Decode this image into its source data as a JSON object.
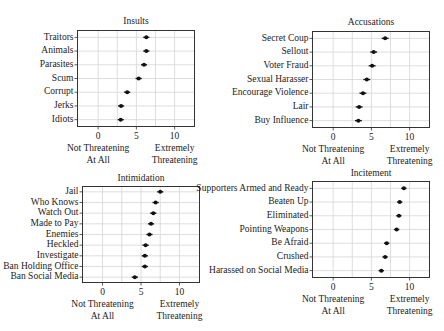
{
  "chart_data": [
    {
      "type": "scatter",
      "title": "Insults",
      "xlabel": "",
      "ylabel": "",
      "xlim": [
        -2.7,
        12.6
      ],
      "xticks": [
        0,
        5,
        10
      ],
      "gridlines_x": [
        0,
        2.5,
        5,
        7.5,
        10
      ],
      "grid": true,
      "x_annotations": {
        "low": [
          "Not Threatening",
          "At All"
        ],
        "high": [
          "Extremely",
          "Threatening"
        ]
      },
      "categories": [
        "Traitors",
        "Animals",
        "Parasites",
        "Scum",
        "Corrupt",
        "Jerks",
        "Idiots"
      ],
      "values": [
        6.3,
        6.3,
        6.0,
        5.3,
        3.8,
        3.0,
        2.95
      ],
      "error_halfwidth": 0.4,
      "frame": {
        "x": 77.5,
        "y": 30.5,
        "w": 117,
        "h": 96
      },
      "title_y": 24
    },
    {
      "type": "scatter",
      "title": "Accusations",
      "xlabel": "",
      "ylabel": "",
      "xlim": [
        -2.7,
        12.6
      ],
      "xticks": [
        0,
        5,
        10
      ],
      "gridlines_x": [
        0,
        2.5,
        5,
        7.5,
        10
      ],
      "grid": true,
      "x_annotations": {
        "low": [
          "Not Threatening",
          "At All"
        ],
        "high": [
          "Extremely",
          "Threatening"
        ]
      },
      "categories": [
        "Secret Coup",
        "Sellout",
        "Voter Fraud",
        "Sexual Harasser",
        "Encourage Violence",
        "Lair",
        "Buy Influence"
      ],
      "values": [
        6.8,
        5.3,
        5.1,
        4.4,
        3.9,
        3.4,
        3.3
      ],
      "error_halfwidth": 0.45,
      "frame": {
        "x": 312.5,
        "y": 31.5,
        "w": 117,
        "h": 96
      },
      "title_y": 25
    },
    {
      "type": "scatter",
      "title": "Intimidation",
      "xlabel": "",
      "ylabel": "",
      "xlim": [
        -2.6,
        12.6
      ],
      "xticks": [
        0,
        5,
        10
      ],
      "gridlines_x": [
        0,
        2.5,
        5,
        7.5,
        10
      ],
      "grid": true,
      "x_annotations": {
        "low": [
          "Not Threatening",
          "At All"
        ],
        "high": [
          "Extremely",
          "Threatening"
        ]
      },
      "categories": [
        "Jail",
        "Who Knows",
        "Watch Out",
        "Made to Pay",
        "Enemies",
        "Heckled",
        "Investigate",
        "Ban Holding Office",
        "Ban Social Media"
      ],
      "values": [
        7.5,
        6.9,
        6.6,
        6.3,
        6.1,
        5.6,
        5.5,
        5.5,
        4.2
      ],
      "error_halfwidth": 0.4,
      "frame": {
        "x": 82.5,
        "y": 186.5,
        "w": 117,
        "h": 96
      },
      "title_y": 181
    },
    {
      "type": "scatter",
      "title": "Incitement",
      "xlabel": "",
      "ylabel": "",
      "xlim": [
        -2.7,
        12.6
      ],
      "xticks": [
        0,
        5,
        10
      ],
      "gridlines_x": [
        0,
        2.5,
        5,
        7.5,
        10
      ],
      "grid": true,
      "x_annotations": {
        "low": [
          "Not Threatening",
          "At All"
        ],
        "high": [
          "Extremely",
          "Threatening"
        ]
      },
      "categories": [
        "Supporters Armed and Ready",
        "Beaten Up",
        "Eliminated",
        "Pointing Weapons",
        "Be Afraid",
        "Crushed",
        "Harassed on Social Media"
      ],
      "values": [
        9.25,
        8.7,
        8.6,
        8.3,
        7.0,
        6.8,
        6.3
      ],
      "error_halfwidth": 0.35,
      "frame": {
        "x": 312.5,
        "y": 181.5,
        "w": 117,
        "h": 96
      },
      "title_y": 176
    }
  ]
}
